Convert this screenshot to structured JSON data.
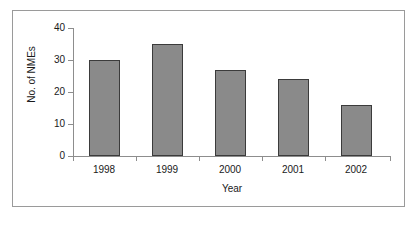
{
  "figure": {
    "background_color": "#ffffff",
    "frame_border_color": "#9a9a9a",
    "axis_color": "#8d8d8d"
  },
  "chart_data": {
    "type": "bar",
    "title": "",
    "subtitle": "",
    "categories": [
      "1998",
      "1999",
      "2000",
      "2001",
      "2002"
    ],
    "values": [
      30,
      35,
      27,
      24,
      16
    ],
    "xlabel": "Year",
    "ylabel": "No. of NMEs",
    "ylim": [
      0,
      40
    ],
    "yticks": [
      "0",
      "10",
      "20",
      "30",
      "40"
    ],
    "ytick_values": [
      0,
      10,
      20,
      30,
      40
    ],
    "grid": false,
    "legend": null,
    "legend_position": "none",
    "bar_fill_color": "#8a8a8a",
    "bar_edge_color": "#3b3b3b",
    "annotations": []
  }
}
